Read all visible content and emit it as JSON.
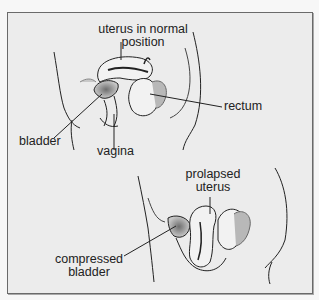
{
  "diagram": {
    "type": "anatomical-illustration",
    "panels": [
      {
        "name": "normal",
        "labels": {
          "uterus_line1": "uterus in normal",
          "uterus_line2": "position",
          "rectum": "rectum",
          "bladder": "bladder",
          "vagina": "vagina"
        }
      },
      {
        "name": "prolapsed",
        "labels": {
          "uterus_line1": "prolapsed",
          "uterus_line2": "uterus",
          "bladder_line1": "compressed",
          "bladder_line2": "bladder"
        }
      }
    ],
    "colors": {
      "background": "#ececec",
      "line": "#222222",
      "shade": "#8a8a8a",
      "frame": "#6a6a6a"
    }
  }
}
